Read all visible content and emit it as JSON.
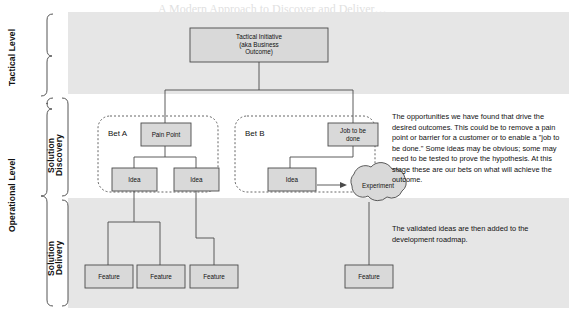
{
  "levels": {
    "tactical": "Tactical Level",
    "operational": "Operational Level"
  },
  "bands": {
    "discovery": "Solution\nDiscovery",
    "discovery_line1": "Solution",
    "discovery_line2": "Discovery",
    "delivery_line1": "Solution",
    "delivery_line2": "Delivery"
  },
  "nodes": {
    "initiative": "Tactical Initiative\n(aka Business\nOutcome)",
    "initiative_l1": "Tactical Initiative",
    "initiative_l2": "(aka Business",
    "initiative_l3": "Outcome)",
    "bet_a": "Bet A",
    "bet_b": "Bet B",
    "pain_point": "Pain Point",
    "job_l1": "Job to be",
    "job_l2": "done",
    "idea": "Idea",
    "experiment": "Experiment",
    "feature": "Feature"
  },
  "annotations": {
    "discovery_text": "The opportunities we have found that drive the desired outcomes. This could be to remove a pain point or barrier for a customer or to enable a \"job to be done.\" Some ideas may be obvious; some may need to be tested to prove the hypothesis. At this stage these are our bets on what will achieve the outcome.",
    "delivery_text": "The validated ideas are then added to the development roadmap."
  },
  "bleed_text": {
    "t1": "A Modern Approach to Discover and Deliver…",
    "t2": "Business Initiative and Customer Value"
  },
  "colors": {
    "band": "#e6e6e6",
    "box_fill": "#d9d9d9",
    "box_stroke": "#4a4a4a",
    "dashed_stroke": "#555555",
    "connector": "#4a4a4a",
    "text": "#111111"
  }
}
